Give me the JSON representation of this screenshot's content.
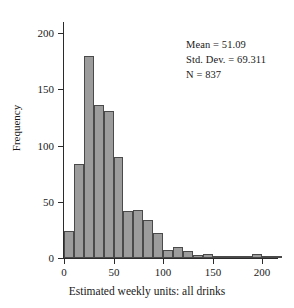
{
  "figure": {
    "background": "#ffffff",
    "bar_fill": "#9c9c9c",
    "bar_stroke": "#4a4a4a",
    "axis_color": "#2b2b2b"
  },
  "annotation": {
    "mean_line": "Mean = 51.09",
    "stddev_line": "Std. Dev. = 69.311",
    "n_line": "N = 837"
  },
  "chart_data": {
    "type": "bar",
    "title": "",
    "subtitle": "",
    "xlabel": "Estimated weekly units: all drinks",
    "ylabel": "Frequency",
    "xlim": [
      0,
      215
    ],
    "ylim": [
      0,
      210
    ],
    "grid": false,
    "legend": null,
    "bin_width": 10,
    "bin_starts": [
      0,
      10,
      20,
      30,
      40,
      50,
      60,
      70,
      80,
      90,
      100,
      110,
      120,
      130,
      140,
      150,
      160,
      170,
      180,
      190,
      200,
      210
    ],
    "categories": [
      "0-10",
      "10-20",
      "20-30",
      "30-40",
      "40-50",
      "50-60",
      "60-70",
      "70-80",
      "80-90",
      "90-100",
      "100-110",
      "110-120",
      "120-130",
      "130-140",
      "140-150",
      "150-160",
      "160-170",
      "170-180",
      "180-190",
      "190-200",
      "200-210",
      "210-220"
    ],
    "values": [
      24,
      84,
      180,
      136,
      131,
      90,
      42,
      43,
      34,
      22,
      7,
      10,
      6,
      3,
      4,
      1,
      1,
      1,
      1,
      4,
      1,
      1
    ],
    "x_ticks": [
      0,
      50,
      100,
      150,
      200
    ],
    "x_tick_labels": [
      "0",
      "50",
      "100",
      "150",
      "200"
    ],
    "y_ticks": [
      0,
      50,
      100,
      150,
      200
    ],
    "y_tick_labels": [
      "0",
      "50",
      "100",
      "150",
      "200"
    ],
    "statistics": {
      "mean": 51.09,
      "std_dev": 69.311,
      "n": 837
    }
  }
}
